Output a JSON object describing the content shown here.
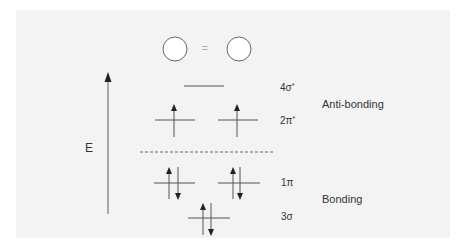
{
  "diagram": {
    "type": "molecular-orbital-energy-diagram",
    "axis": {
      "label": "E"
    },
    "equation": {
      "symbol": "="
    },
    "orbitals": [
      {
        "name": "4σ*",
        "base": "4σ",
        "star": "*",
        "electrons": 0,
        "degeneracy": 1
      },
      {
        "name": "2π*",
        "base": "2π",
        "star": "*",
        "electrons": 2,
        "degeneracy": 2
      },
      {
        "name": "1π",
        "base": "1π",
        "star": "",
        "electrons": 4,
        "degeneracy": 2
      },
      {
        "name": "3σ",
        "base": "3σ",
        "star": "",
        "electrons": 2,
        "degeneracy": 1
      }
    ],
    "groups": {
      "antibonding": "Anti-bonding",
      "bonding": "Bonding"
    },
    "colors": {
      "background": "#f3f3f3",
      "line": "#555555",
      "arrow": "#222222",
      "text": "#333333"
    }
  }
}
